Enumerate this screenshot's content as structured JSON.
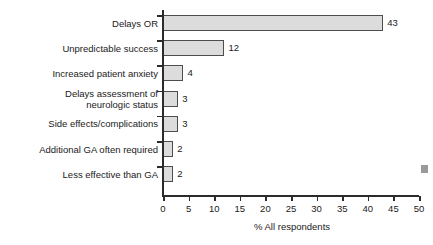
{
  "chart_data": {
    "type": "bar",
    "orientation": "horizontal",
    "title": "",
    "xlabel": "% All respondents",
    "ylabel": "",
    "xlim": [
      0,
      50
    ],
    "xticks": [
      0,
      5,
      10,
      15,
      20,
      25,
      30,
      35,
      40,
      45,
      50
    ],
    "grid": false,
    "legend": null,
    "categories": [
      "Delays OR",
      "Unpredictable success",
      "Increased patient anxiety",
      "Delays assessment of\nneurologic status",
      "Side effects/complications",
      "Additional GA often required",
      "Less effective than GA"
    ],
    "values": [
      43,
      12,
      4,
      3,
      3,
      2,
      2
    ],
    "data_labels": [
      "43",
      "12",
      "4",
      "3",
      "3",
      "2",
      "2"
    ],
    "bar_fill_color": "#dcdcdc",
    "bar_border_color": "#4d4d4d",
    "axis_color": "#2b2b2b",
    "text_color": "#1a1a1a",
    "background_color": "#ffffff"
  },
  "artifact": {
    "name": "scan-artifact-mark",
    "color": "#9a9a9a"
  }
}
